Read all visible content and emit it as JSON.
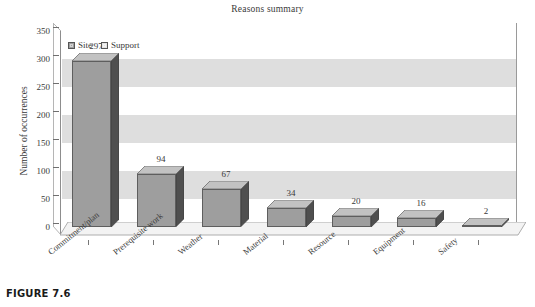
{
  "figure": {
    "caption": "FIGURE 7.6"
  },
  "chart_data": {
    "type": "bar",
    "title": "Reasons summary",
    "xlabel": "",
    "ylabel": "Number of occurrences",
    "categories": [
      "Commitment/plan",
      "Prerequisite work",
      "Weather",
      "Material",
      "Resource",
      "Equipment",
      "Safety"
    ],
    "values": [
      297,
      94,
      67,
      34,
      20,
      16,
      2
    ],
    "series": [
      {
        "name": "Site",
        "values": [
          297,
          94,
          67,
          34,
          20,
          16,
          2
        ]
      }
    ],
    "legend": [
      {
        "label": "Site",
        "color": "#9e9e9e"
      },
      {
        "label": "Support",
        "color": "#e3e3e3"
      }
    ],
    "legend_position": "top-left",
    "ylim": [
      0,
      350
    ],
    "ytick_step": 50,
    "yticks": [
      0,
      50,
      100,
      150,
      200,
      250,
      300,
      350
    ],
    "ytick_labels": [
      "0",
      "50",
      "100",
      "150",
      "200",
      "250",
      "300",
      "350"
    ],
    "data_labels": [
      "297",
      "94",
      "67",
      "34",
      "20",
      "16",
      "2"
    ],
    "grid": "horizontal-bands",
    "band_color": "#dedede",
    "plot_background": "#ffffff",
    "style": "3d-column",
    "bar_face_color": "#9e9e9e",
    "bar_side_color": "#4f4f4f",
    "bar_top_color": "#c2c2c2",
    "label_rotation_deg": -39
  }
}
